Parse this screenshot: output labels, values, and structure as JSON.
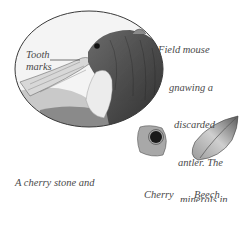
{
  "illustration": {
    "main_subject": "field mouse gnawing antler",
    "labels": {
      "tooth_marks": [
        "Tooth",
        "marks"
      ]
    }
  },
  "captions": {
    "field_mouse": [
      "Field mouse",
      "gnawing a",
      "discarded",
      "antler. The",
      "minerals in",
      "the antler",
      "are very",
      "nutritious."
    ],
    "nibbled": [
      "A cherry stone and",
      "beech nut nibbled by",
      "a woodmouse"
    ],
    "cherry_stone": [
      "Cherry",
      "stone"
    ],
    "beech_nut": [
      "Beech",
      "nut"
    ]
  },
  "colors": {
    "ink": "#3a3a3a",
    "caption": "#4a4a4a",
    "background": "#ffffff"
  }
}
